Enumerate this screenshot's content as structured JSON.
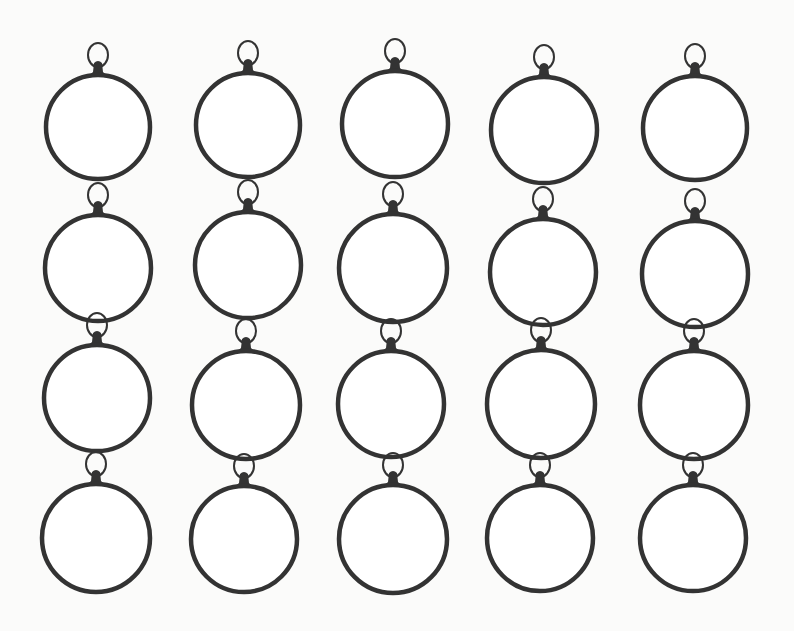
{
  "image": {
    "description": "Scan of 20 empty round pendant bezel frames with jump rings arranged in a 5 by 4 grid",
    "background": "#fbfbfa",
    "stroke_color": "#333333",
    "rows": 4,
    "columns": 5
  },
  "pendants": [
    {
      "cx": 98,
      "cy": 127,
      "r": 52
    },
    {
      "cx": 248,
      "cy": 125,
      "r": 52
    },
    {
      "cx": 395,
      "cy": 124,
      "r": 53
    },
    {
      "cx": 544,
      "cy": 130,
      "r": 53
    },
    {
      "cx": 695,
      "cy": 128,
      "r": 52
    },
    {
      "cx": 98,
      "cy": 268,
      "r": 53
    },
    {
      "cx": 248,
      "cy": 265,
      "r": 53
    },
    {
      "cx": 393,
      "cy": 268,
      "r": 54
    },
    {
      "cx": 543,
      "cy": 272,
      "r": 53
    },
    {
      "cx": 695,
      "cy": 274,
      "r": 53
    },
    {
      "cx": 97,
      "cy": 398,
      "r": 53
    },
    {
      "cx": 246,
      "cy": 405,
      "r": 54
    },
    {
      "cx": 391,
      "cy": 404,
      "r": 53
    },
    {
      "cx": 541,
      "cy": 404,
      "r": 54
    },
    {
      "cx": 694,
      "cy": 405,
      "r": 54
    },
    {
      "cx": 96,
      "cy": 538,
      "r": 54
    },
    {
      "cx": 244,
      "cy": 539,
      "r": 53
    },
    {
      "cx": 393,
      "cy": 539,
      "r": 54
    },
    {
      "cx": 540,
      "cy": 538,
      "r": 53
    },
    {
      "cx": 693,
      "cy": 538,
      "r": 53
    }
  ]
}
